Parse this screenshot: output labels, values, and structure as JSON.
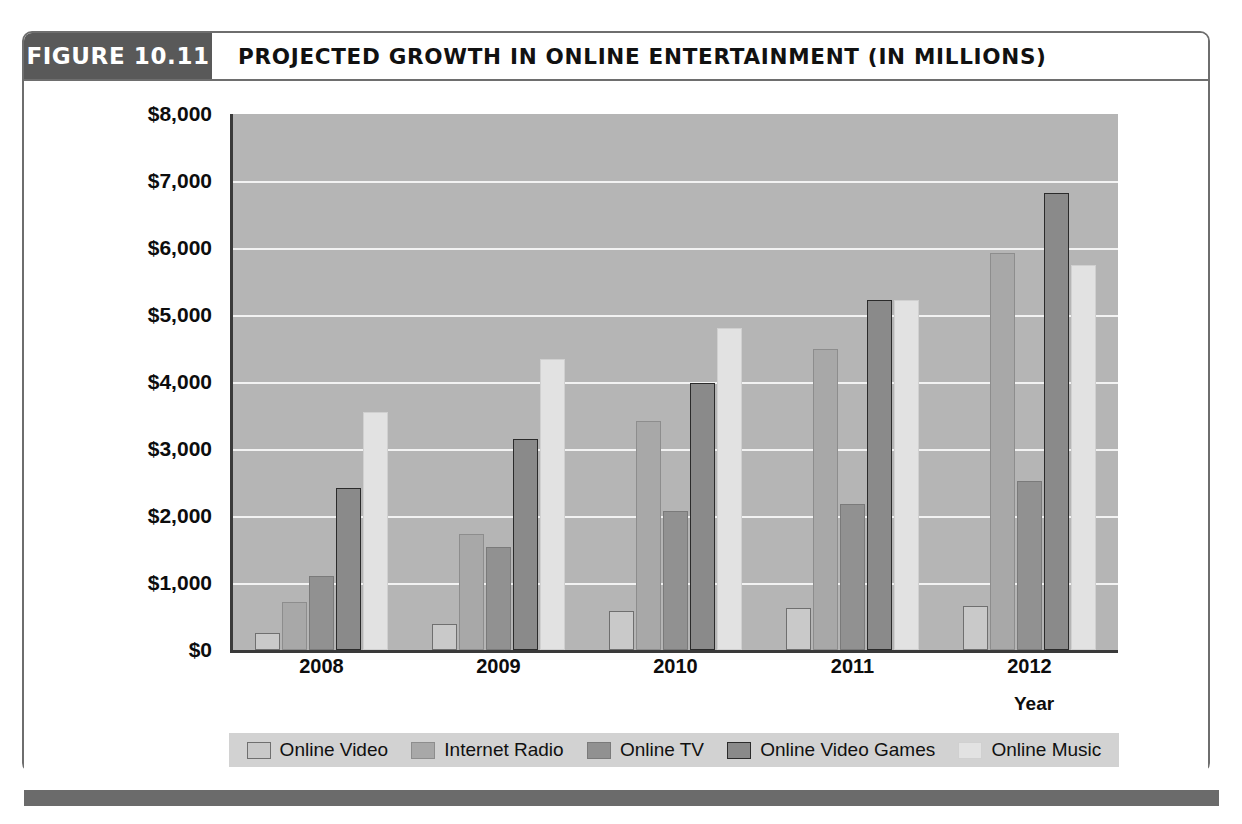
{
  "figure": {
    "tab_label": "FIGURE 10.11",
    "title": "PROJECTED GROWTH IN ONLINE ENTERTAINMENT (IN MILLIONS)"
  },
  "colors": {
    "tab_background": "#595959",
    "plot_background": "#b5b5b5",
    "gridline": "#f2f2f2",
    "axis": "#3a3a3a",
    "legend_background": "#d2d2d2",
    "bottom_rule": "#6b6b6b",
    "series": [
      "#c9c9c9",
      "#a8a8a8",
      "#919191",
      "#8a8a8a",
      "#e2e2e2"
    ]
  },
  "chart_data": {
    "type": "bar",
    "title": "PROJECTED GROWTH IN ONLINE ENTERTAINMENT (IN MILLIONS)",
    "xlabel": "Year",
    "ylabel": "",
    "categories": [
      "2008",
      "2009",
      "2010",
      "2011",
      "2012"
    ],
    "ylim": [
      0,
      8000
    ],
    "ytick_step": 1000,
    "ytick_labels": [
      "$8,000",
      "$7,000",
      "$6,000",
      "$5,000",
      "$4,000",
      "$3,000",
      "$2,000",
      "$1,000",
      "$0"
    ],
    "ytick_values": [
      8000,
      7000,
      6000,
      5000,
      4000,
      3000,
      2000,
      1000,
      0
    ],
    "grid": true,
    "legend_position": "bottom",
    "series": [
      {
        "name": "Online Video",
        "color": "#c9c9c9",
        "border": "#6f6f6f",
        "values": [
          250,
          390,
          580,
          630,
          660
        ]
      },
      {
        "name": "Internet Radio",
        "color": "#a8a8a8",
        "border": "#8d8d8d",
        "values": [
          720,
          1730,
          3420,
          4500,
          5920
        ]
      },
      {
        "name": "Online TV",
        "color": "#919191",
        "border": "#7a7a7a",
        "values": [
          1100,
          1540,
          2080,
          2180,
          2520
        ]
      },
      {
        "name": "Online Video Games",
        "color": "#8a8a8a",
        "border": "#2b2b2b",
        "values": [
          2420,
          3150,
          3980,
          5230,
          6820
        ]
      },
      {
        "name": "Online Music",
        "color": "#e2e2e2",
        "border": "#d0d0d0",
        "values": [
          3550,
          4350,
          4800,
          5230,
          5750
        ]
      }
    ]
  }
}
